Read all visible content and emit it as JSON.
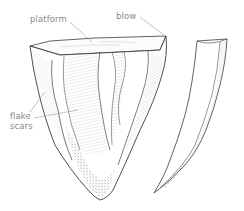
{
  "figure": {
    "labels": {
      "platform": "platform",
      "blow": "blow",
      "flake_line1": "flake",
      "flake_line2": "scars"
    }
  },
  "colors": {
    "outline": "#3a3a3a",
    "hatch": "#8c8c8c",
    "stipple": "#7a7a7a",
    "label": "#8a8a8a",
    "leader": "#9a9a9a"
  }
}
